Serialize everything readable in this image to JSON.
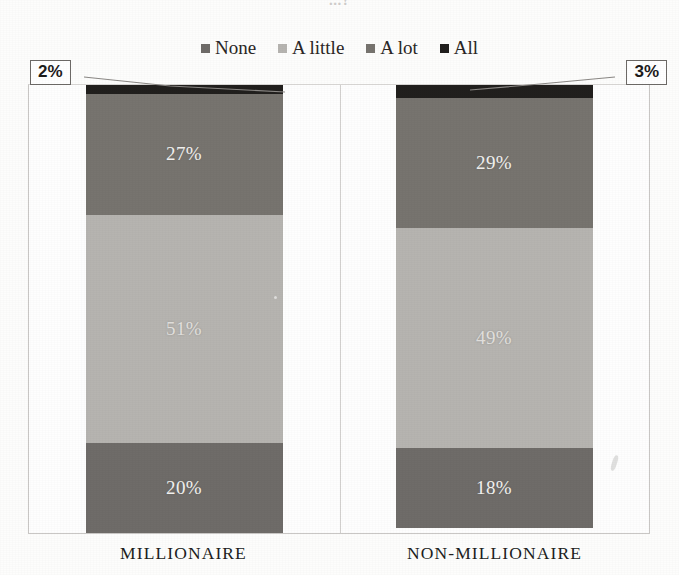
{
  "chart_data": {
    "type": "bar",
    "subtype": "100% stacked bar",
    "title": "...?",
    "xlabel": "",
    "ylabel": "",
    "ylim": [
      0,
      100
    ],
    "grid": false,
    "legend_position": "top-center",
    "categories": [
      "MILLIONAIRE",
      "NON-MILLIONAIRE"
    ],
    "series": [
      {
        "name": "None",
        "values": [
          20,
          18
        ],
        "color": "#6f6c69"
      },
      {
        "name": "A little",
        "values": [
          51,
          49
        ],
        "color": "#b6b4b0"
      },
      {
        "name": "A lot",
        "values": [
          27,
          29
        ],
        "color": "#77746f"
      },
      {
        "name": "All",
        "values": [
          2,
          3
        ],
        "color": "#211f1d"
      }
    ],
    "annotations": [
      {
        "text": "2%",
        "points_to": "MILLIONAIRE / All"
      },
      {
        "text": "3%",
        "points_to": "NON-MILLIONAIRE / All"
      }
    ]
  },
  "legend": {
    "items": [
      {
        "label": "None",
        "color": "#6f6c69"
      },
      {
        "label": "A little",
        "color": "#b6b4b0"
      },
      {
        "label": "A lot",
        "color": "#77746f"
      },
      {
        "label": "All",
        "color": "#211f1d"
      }
    ]
  },
  "bars": [
    {
      "category": "MILLIONAIRE",
      "segments": [
        {
          "series": "All",
          "value": 2,
          "label": "2%",
          "label_visible": false,
          "color": "#211f1d"
        },
        {
          "series": "A lot",
          "value": 27,
          "label": "27%",
          "label_visible": true,
          "color": "#77746f"
        },
        {
          "series": "A little",
          "value": 51,
          "label": "51%",
          "label_visible": true,
          "color": "#b6b4b0"
        },
        {
          "series": "None",
          "value": 20,
          "label": "20%",
          "label_visible": true,
          "color": "#6f6c69"
        }
      ]
    },
    {
      "category": "NON-MILLIONAIRE",
      "segments": [
        {
          "series": "All",
          "value": 3,
          "label": "3%",
          "label_visible": false,
          "color": "#211f1d"
        },
        {
          "series": "A lot",
          "value": 29,
          "label": "29%",
          "label_visible": true,
          "color": "#77746f"
        },
        {
          "series": "A little",
          "value": 49,
          "label": "49%",
          "label_visible": true,
          "color": "#b6b4b0"
        },
        {
          "series": "None",
          "value": 18,
          "label": "18%",
          "label_visible": true,
          "color": "#6f6c69"
        }
      ]
    }
  ],
  "callouts": {
    "left": "2%",
    "right": "3%"
  },
  "axis": {
    "categories": [
      "MILLIONAIRE",
      "NON-MILLIONAIRE"
    ]
  },
  "title": {
    "text": "...?"
  }
}
